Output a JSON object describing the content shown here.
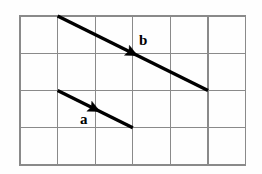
{
  "figure": {
    "background_color": "#fefefe",
    "width": 262,
    "height": 174
  },
  "grid": {
    "columns": 6,
    "rows": 4,
    "line_color": "#8a8a8a",
    "origin_x": 20,
    "origin_y": 16,
    "cell_width": 37.6,
    "cell_height": 37.25,
    "x_lines": [
      20,
      57.6,
      95.2,
      132.8,
      170.4,
      208,
      245.6
    ],
    "y_lines": [
      16,
      53.25,
      90.5,
      127.75,
      165
    ]
  },
  "vectors": [
    {
      "name": "a",
      "label": "a",
      "color": "#000000",
      "start_x": 57.6,
      "start_y": 90.5,
      "end_x": 132.8,
      "end_y": 127.75,
      "grid_components": "2 right, 1 down",
      "label_x": 80,
      "label_y": 124
    },
    {
      "name": "b",
      "label": "b",
      "color": "#000000",
      "start_x": 57.6,
      "start_y": 16,
      "end_x": 208,
      "end_y": 90.5,
      "grid_components": "4 right, 2 down",
      "label_x": 139,
      "label_y": 45
    }
  ],
  "chart_data": {
    "type": "diagram",
    "grid": {
      "columns": 6,
      "rows": 4
    },
    "series": [
      {
        "name": "a",
        "dx_cells": 2,
        "dy_cells": 1,
        "start_cell": [
          1,
          2
        ],
        "end_cell": [
          3,
          3
        ]
      },
      {
        "name": "b",
        "dx_cells": 4,
        "dy_cells": 2,
        "start_cell": [
          1,
          0
        ],
        "end_cell": [
          5,
          2
        ]
      }
    ],
    "annotations": [
      "a",
      "b"
    ]
  }
}
